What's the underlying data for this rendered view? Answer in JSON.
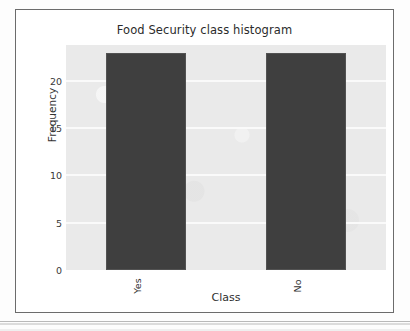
{
  "figure": {
    "card_border_color": "#6c6c6c",
    "background_color": "#ffffff"
  },
  "chart_data": {
    "type": "bar",
    "title": "Food Security class histogram",
    "xlabel": "Class",
    "ylabel": "Frequency",
    "categories": [
      "Yes",
      "No"
    ],
    "values": [
      23,
      23
    ],
    "ylim": [
      0,
      23.8
    ],
    "yticks": [
      0,
      5,
      10,
      15,
      20
    ],
    "ytick_labels": [
      "0",
      "5",
      "10",
      "15",
      "20"
    ],
    "xtick_labels": [
      "Yes",
      "No"
    ],
    "xtick_rotation": 90,
    "grid": true,
    "grid_axis": "y",
    "grid_color": "#fafafa",
    "legend": false,
    "plot_background": "#eaeaea",
    "bar_color": "#3f3f3f",
    "bar_width_fraction": 0.5
  }
}
